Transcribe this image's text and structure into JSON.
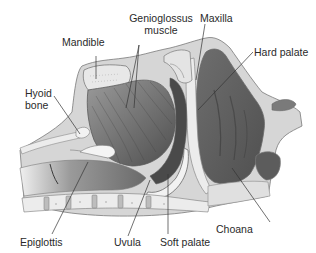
{
  "figure": {
    "type": "anatomical-sagittal-section",
    "colors": {
      "background": "#ffffff",
      "tissue_dark": "#5a5a5a",
      "tissue_mid": "#8a8a8a",
      "tissue_light": "#c8c8c8",
      "bone": "#e6e6e6",
      "outline": "#6a6a6a",
      "leader_line": "#333333",
      "text": "#2a2a2a"
    }
  },
  "labels": {
    "genioglossus_line1": "Genioglossus",
    "genioglossus_line2": "muscle",
    "maxilla": "Maxilla",
    "mandible": "Mandible",
    "hard_palate": "Hard palate",
    "hyoid_line1": "Hyoid",
    "hyoid_line2": "bone",
    "choana": "Choana",
    "epiglottis": "Epiglottis",
    "uvula": "Uvula",
    "soft_palate": "Soft palate"
  }
}
